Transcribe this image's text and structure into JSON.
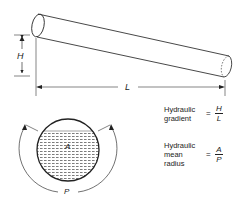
{
  "pipe": {
    "height_label": "H",
    "length_label": "L"
  },
  "cross_section": {
    "area_label": "A",
    "perimeter_label": "P"
  },
  "equations": [
    {
      "name_lines": [
        "Hydraulic",
        "gradient"
      ],
      "equals": "=",
      "numerator": "H",
      "denominator": "L"
    },
    {
      "name_lines": [
        "Hydraulic",
        "mean",
        "radius"
      ],
      "equals": "=",
      "numerator": "A",
      "denominator": "P"
    }
  ]
}
